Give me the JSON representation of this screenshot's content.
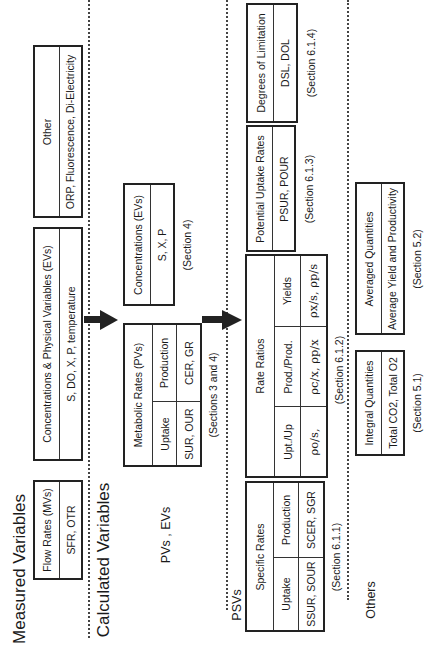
{
  "sections": {
    "measured": "Measured Variables",
    "calculated": "Calculated Variables",
    "pvs_evs": "PVs , EVs",
    "psvs": "PSVs",
    "others": "Others"
  },
  "measured": {
    "flow_rates": {
      "title": "Flow Rates (MVs)",
      "values": "SFR, OTR"
    },
    "concentrations": {
      "title": "Concentrations & Physical Variables (EVs)",
      "values": "S, DO, X, P, temperature"
    },
    "other": {
      "title": "Other",
      "values": "ORP, Fluorescence, Di-Electricity"
    }
  },
  "pvs_evs": {
    "metabolic": {
      "title": "Metabolic Rates (PVs)",
      "col1_header": "Uptake",
      "col1_values": "SUR, OUR",
      "col2_header": "Production",
      "col2_values": "CER, GR",
      "ref": "(Sections 3 and 4)"
    },
    "concentrations": {
      "title": "Concentrations (EVs)",
      "values": "S, X, P",
      "ref": "(Section 4)"
    }
  },
  "psvs": {
    "specific_rates": {
      "title": "Specific Rates",
      "col1_header": "Uptake",
      "col1_values": "SSUR, SOUR",
      "col2_header": "Production",
      "col2_values": "SCER, SGR",
      "ref": "(Section 6.1.1)"
    },
    "rate_ratios": {
      "title": "Rate Ratios",
      "col1_header": "Upt./Up",
      "col1_values": "ρo/s,",
      "col2_header": "Prod./Prod.",
      "col2_values": "ρc/x, ρp/x",
      "col3_header": "Yields",
      "col3_values": "ρx/s, ρp/s",
      "ref": "(Section 6.1.2)"
    },
    "potential_uptake": {
      "title": "Potential Uptake Rates",
      "values": "PSUR, POUR",
      "ref": "(Section 6.1.3)"
    },
    "degrees_limitation": {
      "title": "Degrees of Limitation",
      "values": "DSL, DOL",
      "ref": "(Section 6.1.4)"
    }
  },
  "others": {
    "integral": {
      "title": "Integral Quantities",
      "values": "Total CO2, Total O2",
      "ref": "(Section 5.1)"
    },
    "averaged": {
      "title": "Averaged Quantities",
      "values": "Average Yield and Productivity",
      "ref": "(Section 5.2)"
    }
  }
}
